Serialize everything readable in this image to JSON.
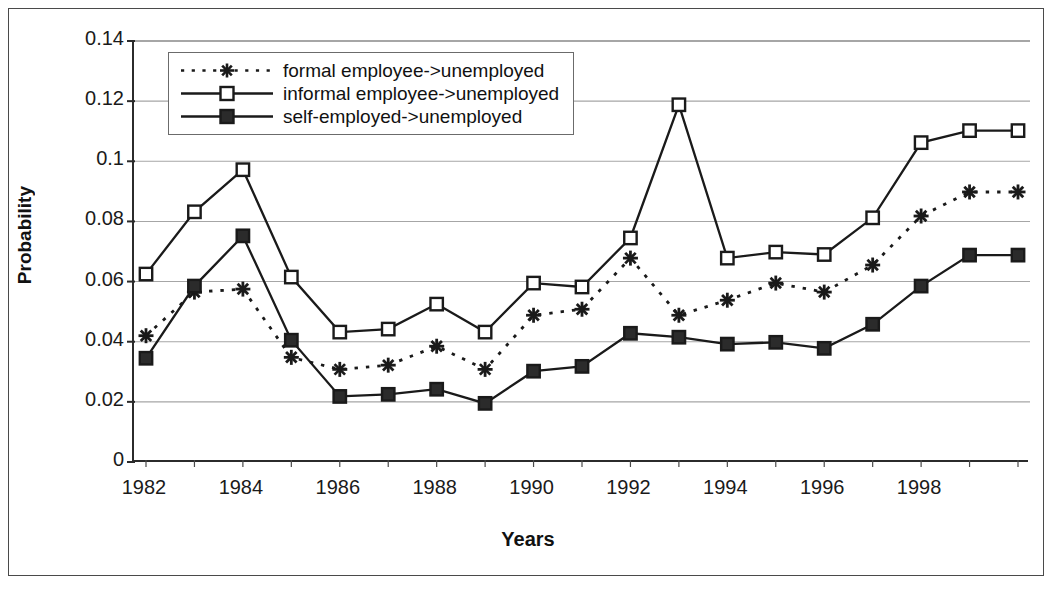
{
  "chart_data": {
    "type": "line",
    "title": "",
    "xlabel": "Years",
    "ylabel": "Probability",
    "grid": true,
    "legend_position": "top-left-inside",
    "xlim": [
      1982,
      2000
    ],
    "ylim": [
      0,
      0.14
    ],
    "ytick_values": [
      0,
      0.02,
      0.04,
      0.06,
      0.08,
      0.1,
      0.12,
      0.14
    ],
    "ytick_labels": [
      "0",
      "0.02",
      "0.04",
      "0.06",
      "0.08",
      "0.1",
      "0.12",
      "0.14"
    ],
    "x": [
      1982,
      1983,
      1984,
      1985,
      1986,
      1987,
      1988,
      1989,
      1990,
      1991,
      1992,
      1993,
      1994,
      1995,
      1996,
      1997,
      1998,
      1999,
      2000
    ],
    "xtick_labels": [
      "1982",
      "",
      "1984",
      "",
      "1986",
      "",
      "1988",
      "",
      "1990",
      "",
      "1992",
      "",
      "1994",
      "",
      "1996",
      "",
      "1998",
      "",
      ""
    ],
    "xtick_labels_shown": [
      "1982",
      "1984",
      "1986",
      "1988",
      "1990",
      "1992",
      "1994",
      "1996",
      "1998"
    ],
    "series": [
      {
        "name": "formal employee->unemployed",
        "marker": "asterisk",
        "line_style": "dotted",
        "color": "#1a1a1a",
        "values": [
          0.042,
          0.0565,
          0.0575,
          0.0348,
          0.0308,
          0.0322,
          0.0385,
          0.0308,
          0.0488,
          0.0508,
          0.0678,
          0.0488,
          0.0538,
          0.0595,
          0.0565,
          0.0655,
          0.0818,
          0.0898,
          0.0898
        ]
      },
      {
        "name": "informal employee->unemployed",
        "marker": "open-square",
        "line_style": "solid",
        "color": "#1a1a1a",
        "values": [
          0.0625,
          0.0832,
          0.0972,
          0.0615,
          0.0432,
          0.0442,
          0.0525,
          0.0432,
          0.0595,
          0.0582,
          0.0745,
          0.1188,
          0.0678,
          0.0698,
          0.069,
          0.0812,
          0.1062,
          0.1102,
          0.1102
        ]
      },
      {
        "name": "self-employed->unemployed",
        "marker": "filled-square",
        "line_style": "solid",
        "color": "#1a1a1a",
        "values": [
          0.0345,
          0.0585,
          0.0752,
          0.0405,
          0.0218,
          0.0225,
          0.0242,
          0.0195,
          0.0302,
          0.0318,
          0.0428,
          0.0415,
          0.0392,
          0.0398,
          0.0378,
          0.0458,
          0.0585,
          0.0688,
          0.0688
        ]
      }
    ]
  },
  "legend": {
    "items": [
      {
        "label": "formal employee->unemployed"
      },
      {
        "label": "informal employee->unemployed"
      },
      {
        "label": "self-employed->unemployed"
      }
    ]
  }
}
